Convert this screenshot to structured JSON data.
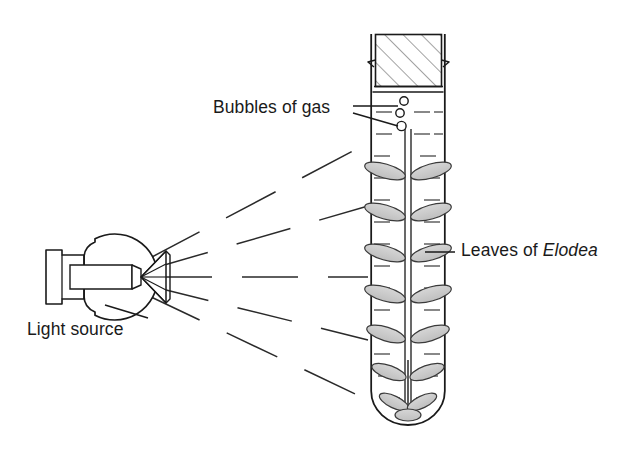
{
  "diagram": {
    "labels": {
      "bubbles": "Bubbles of gas",
      "leaves_prefix": "Leaves of ",
      "leaves_species": "Elodea",
      "light_source": "Light source"
    },
    "colors": {
      "stroke": "#1a1a1a",
      "leaf_fill": "#cccccc",
      "water_dash": "#555555",
      "hatch": "#555555",
      "text": "#1a1a1a",
      "background": "#ffffff"
    },
    "apparatus": {
      "test_tube": {
        "name": "test tube",
        "left": 371,
        "right": 445,
        "top": 33,
        "bottom": 424,
        "wall_width": 1.6
      },
      "stopper": {
        "name": "rubber stopper",
        "hatching": "diagonal",
        "left": 375,
        "right": 442,
        "top": 34,
        "bottom": 86
      },
      "water_surface_y": 92,
      "bubble_count": 3,
      "bubbles": [
        {
          "cx": 404,
          "cy": 101,
          "r": 4.2
        },
        {
          "cx": 400,
          "cy": 113,
          "r": 4.2
        },
        {
          "cx": 401.5,
          "cy": 126,
          "r": 4.6
        }
      ],
      "plant": {
        "name": "Elodea sprig",
        "stem_x": 408,
        "stem_top": 128,
        "stem_bottom": 412,
        "whorl_count": 7,
        "leaves_per_whorl": 2
      },
      "light_bulb": {
        "name": "incandescent light bulb",
        "globe_cx": 113,
        "globe_cy": 277,
        "globe_r": 43,
        "base_left": 45,
        "base_right": 78,
        "orientation": "pointing right"
      },
      "light_rays": {
        "count": 5,
        "style": "dashed",
        "origin_x": 156,
        "origin_y": 277
      }
    }
  }
}
